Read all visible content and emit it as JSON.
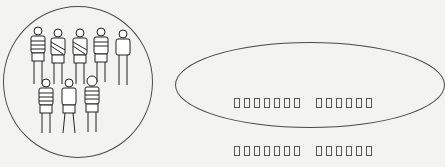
{
  "diagram": {
    "left_circle": {
      "content": "group-of-people-illustration",
      "people_count": 8,
      "rows": [
        5,
        3
      ]
    },
    "right_ellipse": {
      "label_lines": [
        {
          "words": [
            7,
            6
          ],
          "text": "□□□□□□□ □□□□□□"
        },
        {
          "words": [
            7,
            6
          ],
          "text": "□□□□□□□ □□□□□□"
        }
      ]
    }
  }
}
